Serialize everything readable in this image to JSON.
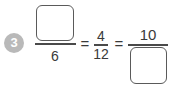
{
  "problem": {
    "number": "3",
    "badge_color": "#b9b9b9",
    "fractions": [
      {
        "numerator": "",
        "denominator": "6",
        "numerator_is_blank": true
      },
      {
        "numerator": "4",
        "denominator": "12"
      },
      {
        "numerator": "10",
        "denominator": "",
        "denominator_is_blank": true
      }
    ],
    "operators": [
      "=",
      "="
    ]
  }
}
